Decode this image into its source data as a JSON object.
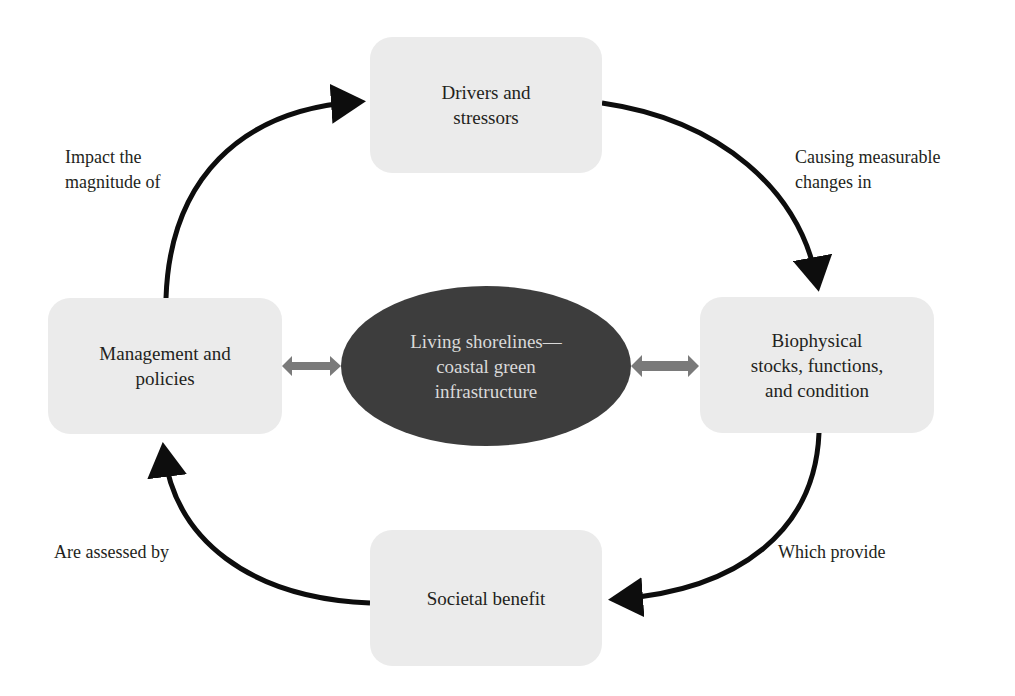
{
  "diagram": {
    "colors": {
      "box_fill": "#ebebeb",
      "center_fill": "#3d3d3d",
      "center_text": "#d9d9d9",
      "arrow": "#0d0d0d",
      "double_arrow": "#7a7a7a",
      "text": "#231f20"
    },
    "center": {
      "label": "Living shorelines—\ncoastal green\ninfrastructure"
    },
    "nodes": {
      "drivers": {
        "label": "Drivers and\nstressors"
      },
      "biophysical": {
        "label": "Biophysical\nstocks, functions,\nand condition"
      },
      "societal": {
        "label": "Societal benefit"
      },
      "management": {
        "label": "Management and\npolicies"
      }
    },
    "edges": [
      {
        "from": "drivers",
        "to": "biophysical",
        "label": "Causing measurable\nchanges in"
      },
      {
        "from": "biophysical",
        "to": "societal",
        "label": "Which provide"
      },
      {
        "from": "societal",
        "to": "management",
        "label": "Are assessed by"
      },
      {
        "from": "management",
        "to": "drivers",
        "label": "Impact the\nmagnitude of"
      }
    ],
    "bidirectional_links": [
      {
        "between": [
          "management",
          "center"
        ]
      },
      {
        "between": [
          "center",
          "biophysical"
        ]
      }
    ]
  }
}
